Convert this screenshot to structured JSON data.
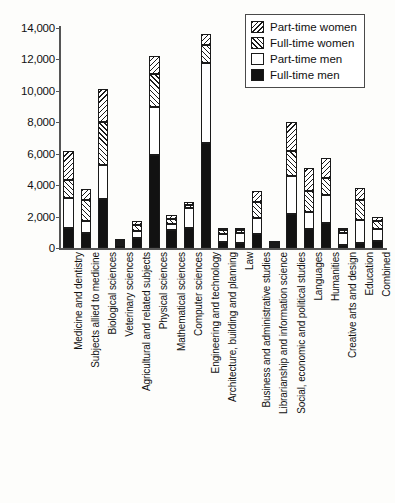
{
  "chart_data": {
    "type": "bar",
    "stacked": true,
    "title": "",
    "xlabel": "",
    "ylabel": "",
    "ylim": [
      0,
      14000
    ],
    "ytick_labels": [
      "0",
      "2,000",
      "4,000",
      "6,000",
      "8,000",
      "10,000",
      "12,000",
      "14,000"
    ],
    "ytick_values": [
      0,
      2000,
      4000,
      6000,
      8000,
      10000,
      12000,
      14000
    ],
    "grid": false,
    "legend_position": "top-right",
    "categories": [
      "Medicine and dentistry",
      "Subjects allied to medicine",
      "Biological sciences",
      "Veterinary sciences",
      "Agricultural and related subjects",
      "Physical sciences",
      "Mathematical sciences",
      "Computer sciences",
      "Engineering and technology",
      "Architecture, building and planning",
      "Law",
      "Business and administrative studies",
      "Librarianship and information science",
      "Social, economic and political studies",
      "Languages",
      "Humanities",
      "Creative arts and design",
      "Education",
      "Combined"
    ],
    "series": [
      {
        "name": "Full-time men",
        "values": [
          1250,
          950,
          3100,
          200,
          650,
          5950,
          1150,
          1250,
          6700,
          400,
          350,
          900,
          150,
          2150,
          1200,
          1600,
          200,
          300,
          450
        ]
      },
      {
        "name": "Part-time men",
        "values": [
          1950,
          800,
          2200,
          150,
          450,
          3000,
          350,
          1300,
          5100,
          500,
          600,
          1000,
          100,
          2450,
          1100,
          1800,
          750,
          1500,
          750
        ]
      },
      {
        "name": "Full-time women",
        "values": [
          1150,
          1300,
          2750,
          100,
          350,
          2150,
          350,
          200,
          1100,
          250,
          200,
          1050,
          50,
          1600,
          1300,
          1050,
          200,
          1250,
          500
        ]
      },
      {
        "name": "Part-time women",
        "values": [
          1850,
          700,
          2100,
          100,
          250,
          1150,
          250,
          150,
          700,
          150,
          150,
          700,
          50,
          1800,
          1500,
          1250,
          100,
          750,
          300
        ]
      }
    ],
    "totals": [
      6200,
      3750,
      10150,
      550,
      1700,
      12250,
      2100,
      2900,
      13600,
      1300,
      1300,
      3650,
      350,
      8000,
      5100,
      5700,
      1250,
      3800,
      2000
    ]
  },
  "legend": {
    "entries": [
      {
        "label": "Part-time women",
        "pattern": "hatch-back"
      },
      {
        "label": "Full-time women",
        "pattern": "hatch-forward"
      },
      {
        "label": "Part-time men",
        "pattern": "white"
      },
      {
        "label": "Full-time men",
        "pattern": "black"
      }
    ]
  }
}
